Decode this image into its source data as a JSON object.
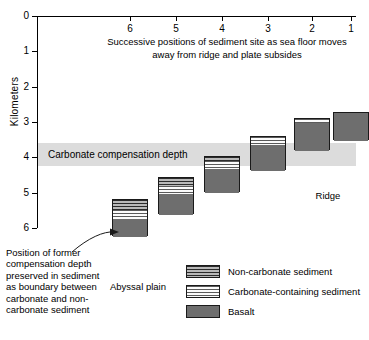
{
  "figure": {
    "y_axis_title": "Kilometers",
    "top_caption": "Successive positions of sediment site as sea floor moves away from ridge and plate subsides",
    "ccd_band_label": "Carbonate compensation depth",
    "abyssal_plain_label": "Abyssal plain",
    "ridge_label": "Ridge",
    "annotation_note": "Position of former compensation depth preserved in sediment as boundary between carbonate and non-carbonate sediment"
  },
  "chart_data": {
    "type": "diagram",
    "title": "Successive positions of sediment site as sea floor moves away from ridge and plate subsides",
    "ylabel": "Kilometers",
    "ylim": [
      0,
      6
    ],
    "y_ticks": [
      "0",
      "1",
      "2",
      "3",
      "4",
      "5",
      "6"
    ],
    "x_ticks": [
      "6",
      "5",
      "4",
      "3",
      "2",
      "1"
    ],
    "x_tick_px": [
      130,
      176,
      222,
      268,
      312,
      351
    ],
    "grid": false,
    "ccd_band": {
      "top_km": 3.5,
      "bottom_km": 4.2,
      "color": "#dcdcdc"
    },
    "legend_position": "bottom-right",
    "columns": [
      {
        "position": "6",
        "label": "Abyssal plain",
        "top_km": 5.17,
        "bottom_km": 6.23,
        "segments": [
          {
            "type": "Non-carbonate sediment",
            "thickness_km": 0.3
          },
          {
            "type": "Carbonate-containing sediment",
            "thickness_km": 0.26
          },
          {
            "type": "Basalt",
            "thickness_km": 0.5
          }
        ]
      },
      {
        "position": "5",
        "top_km": 4.57,
        "bottom_km": 5.6,
        "segments": [
          {
            "type": "Non-carbonate sediment",
            "thickness_km": 0.22
          },
          {
            "type": "Carbonate-containing sediment",
            "thickness_km": 0.21
          },
          {
            "type": "Basalt",
            "thickness_km": 0.6
          }
        ]
      },
      {
        "position": "4",
        "top_km": 3.95,
        "bottom_km": 4.97,
        "segments": [
          {
            "type": "Non-carbonate sediment",
            "thickness_km": 0.12
          },
          {
            "type": "Carbonate-containing sediment",
            "thickness_km": 0.24
          },
          {
            "type": "Basalt",
            "thickness_km": 0.66
          }
        ]
      },
      {
        "position": "3",
        "top_km": 3.4,
        "bottom_km": 4.37,
        "segments": [
          {
            "type": "Carbonate-containing sediment",
            "thickness_km": 0.22
          },
          {
            "type": "Basalt",
            "thickness_km": 0.75
          }
        ]
      },
      {
        "position": "2",
        "top_km": 2.88,
        "bottom_km": 3.78,
        "segments": [
          {
            "type": "Carbonate-containing sediment",
            "thickness_km": 0.13
          },
          {
            "type": "Basalt",
            "thickness_km": 0.77
          }
        ]
      },
      {
        "position": "1",
        "label": "Ridge",
        "top_km": 2.72,
        "bottom_km": 3.52,
        "segments": [
          {
            "type": "Basalt",
            "thickness_km": 0.8
          }
        ]
      }
    ],
    "annotation": {
      "text": "Position of former compensation depth preserved in sediment as boundary between carbonate and non-carbonate sediment",
      "points_to": "carbonate / non-carbonate boundary in column 6"
    }
  },
  "legend": {
    "items": [
      {
        "label": "Non-carbonate sediment",
        "pattern": "dark-horizontal-lines"
      },
      {
        "label": "Carbonate-containing sediment",
        "pattern": "light-horizontal-lines"
      },
      {
        "label": "Basalt",
        "pattern": "solid-gray"
      }
    ]
  }
}
